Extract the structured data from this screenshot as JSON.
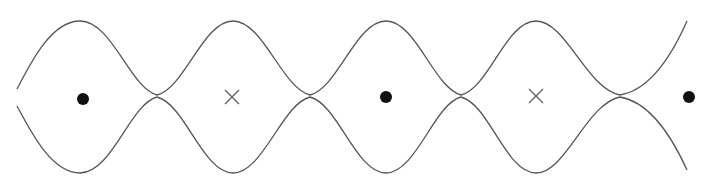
{
  "diagram": {
    "colors": {
      "background": "#ffffff",
      "curve": "#555555",
      "dot": "#111111",
      "cross": "#666666"
    },
    "axis_y": 97,
    "amplitude_top": 20,
    "amplitude_bottom": 173,
    "pinch_points": [
      {
        "x": 157,
        "y": 96
      },
      {
        "x": 310,
        "y": 96
      },
      {
        "x": 461,
        "y": 96
      },
      {
        "x": 620,
        "y": 96
      }
    ],
    "markers": [
      {
        "type": "dot",
        "x": 83,
        "y": 99,
        "r": 6
      },
      {
        "type": "cross",
        "x": 232,
        "y": 97,
        "size": 7
      },
      {
        "type": "dot",
        "x": 386,
        "y": 97,
        "r": 6
      },
      {
        "type": "cross",
        "x": 536,
        "y": 96,
        "size": 7
      },
      {
        "type": "dot",
        "x": 689,
        "y": 97,
        "r": 6
      }
    ]
  }
}
